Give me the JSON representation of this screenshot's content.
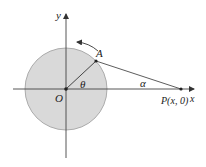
{
  "diagram": {
    "type": "geometry",
    "colors": {
      "circle_fill": "#d9d9d9",
      "circle_stroke": "#9a9a9a",
      "line": "#333333",
      "axis": "#444444",
      "background": "#ffffff"
    },
    "geometry": {
      "origin": [
        66,
        89
      ],
      "radius": 41,
      "point_A": [
        96,
        61
      ],
      "point_P": [
        181,
        89
      ],
      "x_axis": {
        "from": 13,
        "to": 195,
        "y": 89
      },
      "y_axis": {
        "from": 158,
        "to": 13,
        "x": 66
      },
      "rotation_arrow": {
        "from": [
          98,
          50
        ],
        "to": [
          76,
          41
        ],
        "direction": "counterclockwise"
      }
    },
    "labels": {
      "y_axis": "y",
      "x_axis": "x",
      "origin": "O",
      "point_A": "A",
      "point_P": "P(x, 0)",
      "angle_theta": "θ",
      "angle_alpha": "α"
    }
  }
}
